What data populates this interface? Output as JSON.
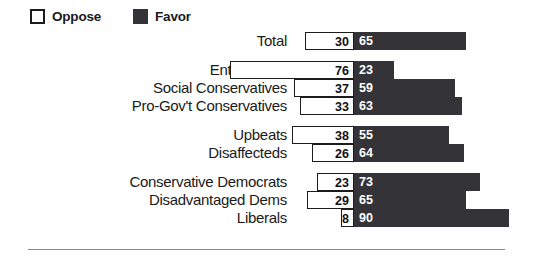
{
  "legend": {
    "items": [
      {
        "label": "Oppose",
        "swatch": "oppose-swatch",
        "color": "#FFFFFF"
      },
      {
        "label": "Favor",
        "swatch": "favor-swatch",
        "color": "#333338"
      }
    ]
  },
  "chart_data": {
    "type": "bar",
    "title": "",
    "subtitle": "",
    "xlabel": "",
    "ylabel": "",
    "orientation": "horizontal",
    "style": "diverging-stacked",
    "grid": false,
    "legend_position": "top-left",
    "axis_center_label": "",
    "value_unit": "percent",
    "xlim": [
      0,
      100
    ],
    "series": [
      {
        "name": "Oppose",
        "color": "#FFFFFF",
        "values": [
          30,
          76,
          37,
          33,
          38,
          26,
          23,
          29,
          8
        ]
      },
      {
        "name": "Favor",
        "color": "#333338",
        "values": [
          65,
          23,
          59,
          63,
          55,
          64,
          73,
          65,
          90
        ]
      }
    ],
    "categories": [
      "Total",
      "Enterprisers",
      "Social Conservatives",
      "Pro-Gov't Conservatives",
      "Upbeats",
      "Disaffecteds",
      "Conservative Democrats",
      "Disadvantaged Dems",
      "Liberals"
    ],
    "groups": [
      {
        "name": "total-group",
        "rows": [
          {
            "label": "Total",
            "oppose": 30,
            "favor": 65
          }
        ]
      },
      {
        "name": "conservatives-group",
        "rows": [
          {
            "label": "Enterprisers",
            "oppose": 76,
            "favor": 23
          },
          {
            "label": "Social Conservatives",
            "oppose": 37,
            "favor": 59
          },
          {
            "label": "Pro-Gov't Conservatives",
            "oppose": 33,
            "favor": 63
          }
        ]
      },
      {
        "name": "middle-group",
        "rows": [
          {
            "label": "Upbeats",
            "oppose": 38,
            "favor": 55
          },
          {
            "label": "Disaffecteds",
            "oppose": 26,
            "favor": 64
          }
        ]
      },
      {
        "name": "democrats-group",
        "rows": [
          {
            "label": "Conservative Democrats",
            "oppose": 23,
            "favor": 73
          },
          {
            "label": "Disadvantaged Dems",
            "oppose": 29,
            "favor": 65
          },
          {
            "label": "Liberals",
            "oppose": 8,
            "favor": 90
          }
        ]
      }
    ]
  }
}
